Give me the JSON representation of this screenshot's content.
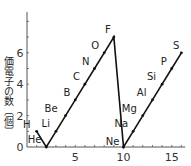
{
  "chart_data": {
    "type": "line",
    "title": "",
    "xlabel": "",
    "ylabel": "価電子の数〔個〕",
    "xlim": [
      0,
      16
    ],
    "ylim": [
      0,
      8
    ],
    "x_ticks": [
      5,
      10,
      15
    ],
    "y_ticks": [
      0,
      2,
      4,
      6
    ],
    "grid": false,
    "legend": null,
    "series": [
      {
        "name": "valence electrons",
        "x": [
          1,
          2,
          3,
          4,
          5,
          6,
          7,
          8,
          9,
          10,
          11,
          12,
          13,
          14,
          15,
          16
        ],
        "labels": [
          "H",
          "He",
          "Li",
          "Be",
          "B",
          "C",
          "N",
          "O",
          "F",
          "Ne",
          "Na",
          "Mg",
          "Al",
          "Si",
          "P",
          "S"
        ],
        "values": [
          1,
          0,
          1,
          2,
          3,
          4,
          5,
          6,
          7,
          0,
          1,
          2,
          3,
          4,
          5,
          6
        ]
      }
    ]
  },
  "axis": {
    "y_label": "価電子の数〔個〕",
    "x_tick_labels": [
      "5",
      "10",
      "15"
    ],
    "y_tick_labels": [
      "0",
      "2",
      "4",
      "6"
    ]
  }
}
